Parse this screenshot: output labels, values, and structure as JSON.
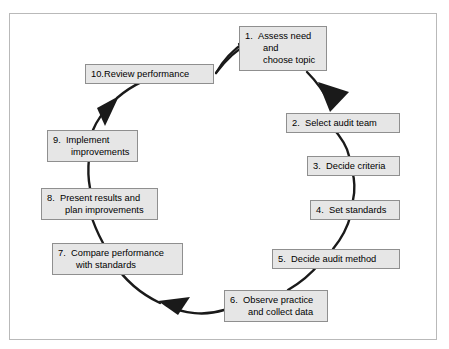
{
  "diagram": {
    "type": "cycle-diagram",
    "direction": "clockwise",
    "colors": {
      "box_fill": "#e6e6e6",
      "box_border": "#8f8f8f",
      "arrow": "#1a1a1a",
      "frame_border": "#b9b9b9",
      "background": "#ffffff"
    },
    "steps": [
      {
        "number": "1.",
        "lines": [
          "Assess need",
          "and",
          "choose topic"
        ],
        "full_text": "1. Assess need and choose topic"
      },
      {
        "number": "2.",
        "lines": [
          "Select audit team"
        ],
        "full_text": "2. Select audit team"
      },
      {
        "number": "3.",
        "lines": [
          "Decide criteria"
        ],
        "full_text": "3. Decide criteria"
      },
      {
        "number": "4.",
        "lines": [
          "Set standards"
        ],
        "full_text": "4. Set standards"
      },
      {
        "number": "5.",
        "lines": [
          "Decide audit method"
        ],
        "full_text": "5. Decide audit method"
      },
      {
        "number": "6.",
        "lines": [
          "Observe practice",
          "and collect data"
        ],
        "full_text": "6. Observe practice and collect data"
      },
      {
        "number": "7.",
        "lines": [
          "Compare performance",
          "with standards"
        ],
        "full_text": "7. Compare performance with standards"
      },
      {
        "number": "8.",
        "lines": [
          "Present results and",
          "plan improvements"
        ],
        "full_text": "8. Present results and plan improvements"
      },
      {
        "number": "9.",
        "lines": [
          "Implement",
          "improvements"
        ],
        "full_text": "9. Implement improvements"
      },
      {
        "number": "10.",
        "lines": [
          "Review performance"
        ],
        "full_text": "10. Review performance"
      }
    ]
  }
}
